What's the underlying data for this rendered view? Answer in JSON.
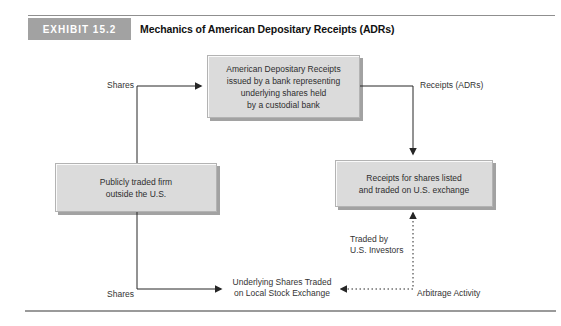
{
  "header": {
    "badge": "EXHIBIT 15.2",
    "title": "Mechanics of American Depositary Receipts (ADRs)"
  },
  "boxes": {
    "adr_bank": {
      "text": "American Depositary Receipts\nissued by a bank representing\nunderlying shares held\nby a custodial bank"
    },
    "foreign_firm": {
      "text": "Publicly traded firm\noutside the U.S."
    },
    "us_exchange": {
      "text": "Receipts for shares listed\nand traded on U.S. exchange"
    }
  },
  "labels": {
    "shares_top": "Shares",
    "receipts_adrs": "Receipts (ADRs)",
    "shares_bottom": "Shares",
    "underlying_shares": "Underlying Shares Traded\non Local Stock Exchange",
    "traded_by_us_investors": "Traded by\nU.S. Investors",
    "arbitrage_activity": "Arbitrage Activity"
  },
  "edges": [
    {
      "from": "foreign_firm",
      "to": "adr_bank",
      "label": "Shares",
      "style": "solid"
    },
    {
      "from": "adr_bank",
      "to": "us_exchange",
      "label": "Receipts (ADRs)",
      "style": "solid"
    },
    {
      "from": "foreign_firm",
      "to": "underlying_shares",
      "label": "Shares",
      "style": "solid"
    },
    {
      "from": "underlying_shares",
      "to": "us_exchange",
      "label": "Arbitrage Activity",
      "style": "dotted",
      "bidirectional": true
    }
  ],
  "colors": {
    "badge_bg": "#a2a2a2",
    "badge_text": "#ffffff",
    "box_fill": "#dbdbdb",
    "box_shadow": "#a2a2a2",
    "line": "#262626",
    "rule": "#8f8f8f",
    "text": "#2e2e2e"
  }
}
